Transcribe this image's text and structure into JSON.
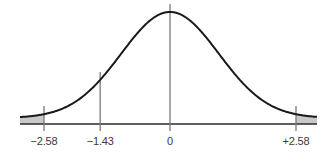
{
  "chart_data": {
    "type": "line",
    "title": "",
    "xlabel": "",
    "ylabel": "",
    "distribution": "normal",
    "mean": 0,
    "sd": 1,
    "xlim": [
      -3.4,
      3.4
    ],
    "grid": false,
    "legend": null,
    "tick_labels": [
      "−2.58",
      "−1.43",
      "0",
      "+2.58"
    ],
    "tick_values": [
      -2.58,
      -1.43,
      0,
      2.58
    ],
    "vertical_lines": [
      {
        "x": -2.58,
        "label": "−2.58",
        "role": "critical-value-left"
      },
      {
        "x": -1.43,
        "label": "−1.43",
        "role": "test-statistic"
      },
      {
        "x": 0,
        "label": "0",
        "role": "mean"
      },
      {
        "x": 2.58,
        "label": "+2.58",
        "role": "critical-value-right"
      }
    ],
    "shaded_regions": [
      {
        "from": -3.4,
        "to": -2.58,
        "color": "#c8c8c8"
      },
      {
        "from": 2.58,
        "to": 3.4,
        "color": "#c8c8c8"
      }
    ]
  },
  "colors": {
    "curve": "#1a1a1a",
    "axis": "#2a2a2a",
    "vline": "#7a7a7a",
    "shade": "#c8c8c8",
    "label": "#3a3a3a"
  }
}
